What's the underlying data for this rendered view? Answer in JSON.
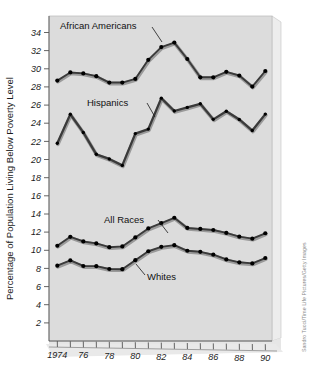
{
  "figure": {
    "name": "poverty-level-line-chart",
    "background_color": "#ffffff",
    "panel_color": "#dcdcdc",
    "panel_edge_light": "#f2f2f2",
    "panel_edge_dark": "#b4b4b4",
    "line_color": "#3a3a3a",
    "line_highlight_color": "#9a9a9a",
    "marker_color": "#000000"
  },
  "credit": {
    "text": "Sandro Tucci/Time Life Pictures/Getty Images"
  },
  "chart_data": {
    "type": "line",
    "title": "",
    "xlabel": "",
    "ylabel": "Percentage of Population Living Below Poverty Level",
    "xlim": [
      1974,
      1990
    ],
    "ylim": [
      0,
      34
    ],
    "grid": false,
    "legend_position": "inline-annotations",
    "x": [
      1974,
      1975,
      1976,
      1977,
      1978,
      1979,
      1980,
      1981,
      1982,
      1983,
      1984,
      1985,
      1986,
      1987,
      1988,
      1989,
      1990
    ],
    "xtick_values": [
      1974,
      1976,
      1978,
      1980,
      1982,
      1984,
      1986,
      1988,
      1990
    ],
    "xtick_labels": [
      "1974",
      "76",
      "78",
      "80",
      "82",
      "84",
      "86",
      "88",
      "90"
    ],
    "ytick_values": [
      2,
      4,
      6,
      8,
      10,
      12,
      14,
      16,
      18,
      20,
      22,
      24,
      26,
      28,
      30,
      32,
      34
    ],
    "ytick_labels": [
      "2",
      "4",
      "6",
      "8",
      "10",
      "12",
      "14",
      "16",
      "18",
      "20",
      "22",
      "24",
      "26",
      "28",
      "30",
      "32",
      "34"
    ],
    "series": [
      {
        "name": "African Americans",
        "label": "African Americans",
        "values": [
          28.7,
          29.6,
          29.5,
          29.2,
          28.5,
          28.5,
          28.9,
          31.0,
          32.4,
          32.9,
          31.1,
          29.1,
          29.1,
          29.7,
          29.3,
          28.1,
          29.8
        ]
      },
      {
        "name": "Hispanics",
        "label": "Hispanics",
        "values": [
          21.8,
          25.0,
          23.0,
          20.6,
          20.1,
          19.4,
          22.9,
          23.4,
          26.8,
          25.4,
          25.8,
          26.2,
          24.5,
          25.4,
          24.5,
          23.3,
          25.1
        ]
      },
      {
        "name": "All Races",
        "label": "All Races",
        "values": [
          10.5,
          11.5,
          11.0,
          10.8,
          10.4,
          10.5,
          11.5,
          12.5,
          13.1,
          13.7,
          12.6,
          12.5,
          12.4,
          12.1,
          11.7,
          11.5,
          12.1
        ]
      },
      {
        "name": "Whites",
        "label": "Whites",
        "values": [
          8.3,
          8.9,
          8.3,
          8.3,
          8.0,
          8.0,
          9.0,
          10.0,
          10.5,
          10.7,
          10.1,
          10.0,
          9.7,
          9.2,
          8.9,
          8.8,
          9.4
        ]
      }
    ],
    "annotations": [
      {
        "text": "African Americans",
        "series": "African Americans",
        "points_to_year": 1981
      },
      {
        "text": "Hispanics",
        "series": "Hispanics",
        "points_to_year": 1981
      },
      {
        "text": "All Races",
        "series": "All Races",
        "points_to_year": 1983
      },
      {
        "text": "Whites",
        "series": "Whites",
        "points_to_year": 1981
      }
    ]
  }
}
